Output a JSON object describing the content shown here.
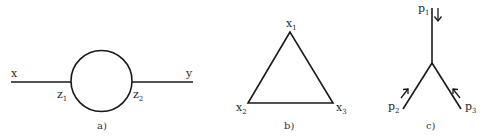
{
  "panels": [
    {
      "caption": "a)",
      "type": "self-energy loop",
      "labels": {
        "left_external": "x",
        "right_external": "y",
        "left_vertex": "z",
        "left_vertex_sub": "1",
        "right_vertex": "z",
        "right_vertex_sub": "2"
      }
    },
    {
      "caption": "b)",
      "type": "triangle",
      "labels": {
        "top": "x",
        "top_sub": "1",
        "bottom_left": "x",
        "bottom_left_sub": "2",
        "bottom_right": "x",
        "bottom_right_sub": "3"
      }
    },
    {
      "caption": "c)",
      "type": "three-point vertex",
      "labels": {
        "top": "p",
        "top_sub": "1",
        "bottom_left": "p",
        "bottom_left_sub": "2",
        "bottom_right": "p",
        "bottom_right_sub": "3"
      }
    }
  ],
  "colors": {
    "stroke": "#1a1a1a",
    "text": "#2a2a2a"
  }
}
